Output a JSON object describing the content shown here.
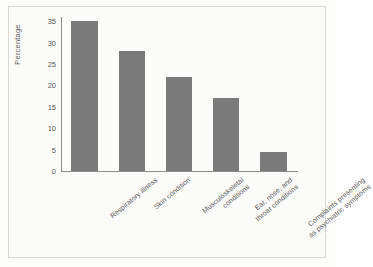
{
  "chart_data": {
    "type": "bar",
    "title": "",
    "subtitle": "",
    "xlabel": "",
    "ylabel": "Percentage",
    "categories": [
      "Respiratory illness",
      "Skin condition",
      "Musculoskeletal\nconditions",
      "Ear, nose, and\nthroat conditions",
      "Complaints presenting\nas psychiatric symptoms"
    ],
    "values": [
      35,
      28,
      22,
      17,
      4.5
    ],
    "ylim": [
      0,
      36
    ],
    "yticks": [
      0,
      5,
      10,
      15,
      20,
      25,
      30,
      35
    ],
    "ytick_labels": [
      "0",
      "5",
      "10",
      "15",
      "20",
      "25",
      "30",
      "35"
    ],
    "grid": false,
    "legend": false,
    "bar_color": "#7a7a7a",
    "axis_color": "#8d8d8b",
    "background": "#fbfbfa"
  }
}
